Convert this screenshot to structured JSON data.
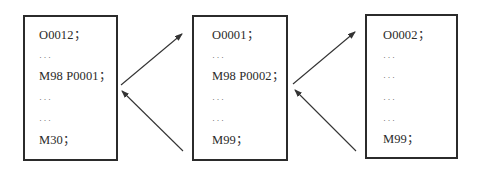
{
  "diagram": {
    "colors": {
      "border": "#2b2b2b",
      "text": "#2a2a2a",
      "arrow": "#333333",
      "background": "#ffffff"
    },
    "boxes": [
      {
        "id": "main-program",
        "lines": [
          "O0012；",
          "···",
          "M98 P0001；",
          "···",
          "···",
          "M30；"
        ]
      },
      {
        "id": "subprogram-1",
        "lines": [
          "O0001；",
          "···",
          "M98 P0002；",
          "···",
          "···",
          "M99；"
        ]
      },
      {
        "id": "subprogram-2",
        "lines": [
          "O0002；",
          "···",
          "···",
          "···",
          "···",
          "M99；"
        ]
      }
    ],
    "arrows": [
      {
        "from": "main-program",
        "to": "subprogram-1",
        "meaning": "call"
      },
      {
        "from": "subprogram-1",
        "to": "main-program",
        "meaning": "return"
      },
      {
        "from": "subprogram-1",
        "to": "subprogram-2",
        "meaning": "call"
      },
      {
        "from": "subprogram-2",
        "to": "subprogram-1",
        "meaning": "return"
      }
    ]
  }
}
